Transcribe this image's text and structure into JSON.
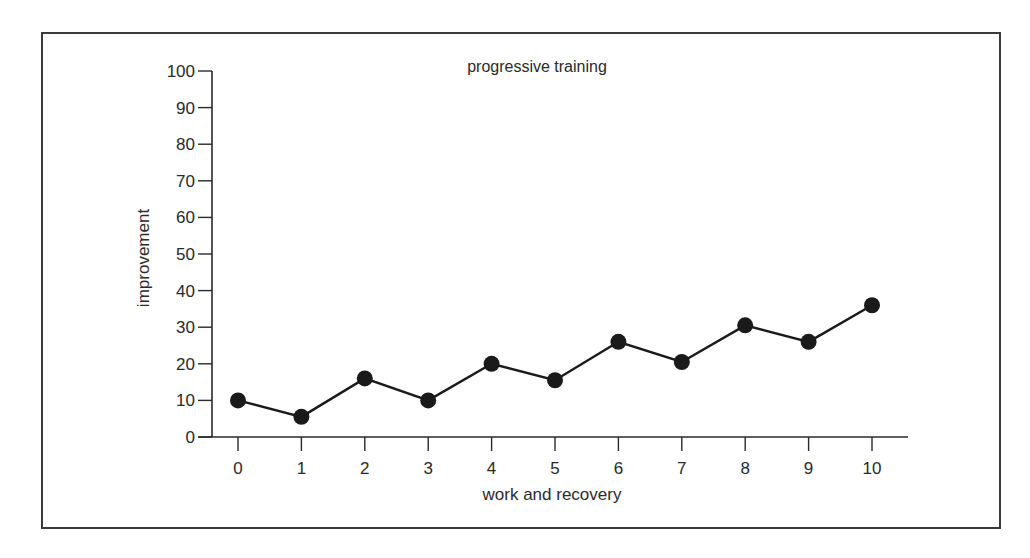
{
  "chart_data": {
    "type": "line",
    "title": "progressive training",
    "xlabel": "work and recovery",
    "ylabel": "improvement",
    "x": [
      0,
      1,
      2,
      3,
      4,
      5,
      6,
      7,
      8,
      9,
      10
    ],
    "series": [
      {
        "name": "progressive training",
        "values": [
          10,
          5.5,
          16,
          10,
          20,
          15.5,
          26,
          20.5,
          30.5,
          26,
          36
        ],
        "marker": "filled-circle",
        "color": "#1a1a1a"
      }
    ],
    "xlim": [
      0,
      10
    ],
    "ylim": [
      0,
      100
    ],
    "yticks": [
      0,
      10,
      20,
      30,
      40,
      50,
      60,
      70,
      80,
      90,
      100
    ],
    "xticks": [
      0,
      1,
      2,
      3,
      4,
      5,
      6,
      7,
      8,
      9,
      10
    ],
    "grid": false,
    "legend": null
  },
  "colors": {
    "line": "#1a1a1a",
    "axis": "#2a2a2a",
    "frame": "#3a3a3a",
    "background": "#ffffff"
  }
}
